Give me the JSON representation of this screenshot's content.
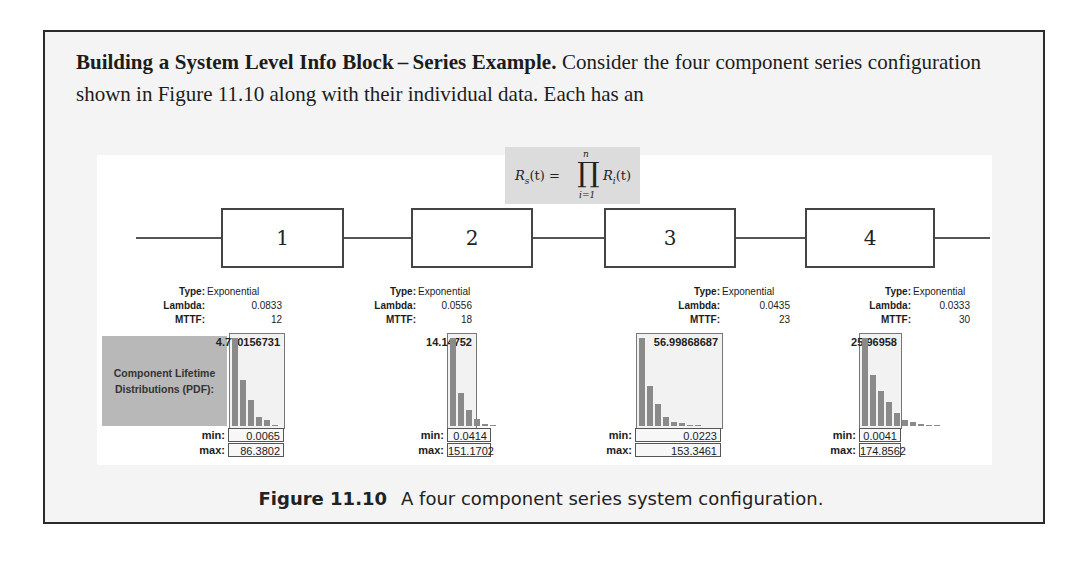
{
  "paragraph": {
    "heading": "Building a System Level Info Block – Series Example",
    "heading_end": ".",
    "text_line1": " Consider the four component",
    "text_line2": "series configuration shown in Figure 11.10 along with their individual data. Each has an"
  },
  "formula": {
    "lhs": "R",
    "lhs_sub": "s",
    "arg": "(t) =",
    "prod": "∏",
    "prod_upper": "n",
    "prod_lower": "i=1",
    "rhs": "R",
    "rhs_sub": "i",
    "rhs_arg": "(t)"
  },
  "side_label": "Component Lifetime Distributions (PDF):",
  "labels": {
    "type": "Type:",
    "lambda": "Lambda:",
    "mttf": "MTTF:",
    "min": "min:",
    "max": "max:"
  },
  "components": [
    {
      "id": "1",
      "type": "Exponential",
      "lambda": "0.0833",
      "mttf": "12",
      "peak": "4.770156731",
      "min": "0.0065",
      "max": "86.3802",
      "bars": [
        100,
        52,
        30,
        10,
        7,
        1
      ]
    },
    {
      "id": "2",
      "type": "Exponential",
      "lambda": "0.0556",
      "mttf": "18",
      "peak": "14.14752",
      "min": "0.0414",
      "max": "151.1702",
      "bars": [
        100,
        38,
        18,
        8,
        2,
        1
      ]
    },
    {
      "id": "3",
      "type": "Exponential",
      "lambda": "0.0435",
      "mttf": "23",
      "peak": "56.99868687",
      "min": "0.0223",
      "max": "153.3461",
      "bars": [
        100,
        45,
        25,
        10,
        4,
        3,
        1,
        1
      ]
    },
    {
      "id": "4",
      "type": "Exponential",
      "lambda": "0.0333",
      "mttf": "30",
      "peak": "25.96958",
      "min": "0.0041",
      "max": "174.8562",
      "bars": [
        100,
        58,
        40,
        27,
        15,
        7,
        4,
        2,
        1,
        1
      ]
    }
  ],
  "caption": {
    "number": "Figure 11.10",
    "text": "A four component series system configuration."
  },
  "colors": {
    "bar": "#8a8a8a",
    "side_label_bg": "#b8b8b8",
    "formula_bg": "#dcdcdc"
  }
}
